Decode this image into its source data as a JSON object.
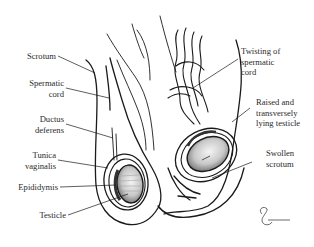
{
  "diagram": {
    "colors": {
      "ink": "#1a1a1a",
      "label": "#2a2a2a",
      "background": "#ffffff",
      "shade": "#9a9a9a"
    },
    "labels_left": [
      {
        "id": "scrotum",
        "text": "Scrotum"
      },
      {
        "id": "spermatic-cord",
        "text": "Spermatic\ncord"
      },
      {
        "id": "ductus-deferens",
        "text": "Ductus\ndeferens"
      },
      {
        "id": "tunica-vaginalis",
        "text": "Tunica\nvaginalis"
      },
      {
        "id": "epididymis",
        "text": "Epididymis"
      },
      {
        "id": "testicle",
        "text": "Testicle"
      }
    ],
    "labels_right": [
      {
        "id": "twisting-of-spermatic-cord",
        "text": "Twisting of\nspermatic\ncord"
      },
      {
        "id": "raised-transverse-testicle",
        "text": "Raised and\ntransversely\nlying testicle"
      },
      {
        "id": "swollen-scrotum",
        "text": "Swollen\nscrotum"
      }
    ],
    "signature": "artist-signature"
  }
}
